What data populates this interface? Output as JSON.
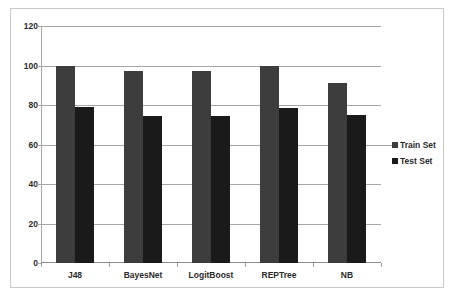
{
  "chart_data": {
    "type": "bar",
    "title": "",
    "xlabel": "",
    "ylabel": "",
    "categories": [
      "J48",
      "BayesNet",
      "LogitBoost",
      "REPTree",
      "NB"
    ],
    "series": [
      {
        "name": "Train Set",
        "color": "#3d3d3d",
        "values": [
          100,
          97,
          97,
          100,
          91
        ]
      },
      {
        "name": "Test Set",
        "color": "#1a1a1a",
        "values": [
          79,
          74.5,
          74.5,
          78.5,
          75
        ]
      }
    ],
    "ylim": [
      0,
      120
    ],
    "yticks": [
      0,
      20,
      40,
      60,
      80,
      100,
      120
    ],
    "ytick_labels": [
      "0",
      "20",
      "40",
      "60",
      "80",
      "100",
      "120"
    ],
    "grid": true,
    "legend_position": "right",
    "legend": [
      "Train Set",
      "Test Set"
    ],
    "frame": true
  },
  "axes": {
    "y_tick_labels": [
      "120",
      "100",
      "80",
      "60",
      "40",
      "20",
      "0"
    ],
    "x_tick_labels": [
      "J48",
      "BayesNet",
      "LogitBoost",
      "REPTree",
      "NB"
    ]
  },
  "legend": {
    "items": [
      {
        "label": "Train Set",
        "swatch": "train-swatch"
      },
      {
        "label": "Test Set",
        "swatch": "test-swatch"
      }
    ]
  }
}
